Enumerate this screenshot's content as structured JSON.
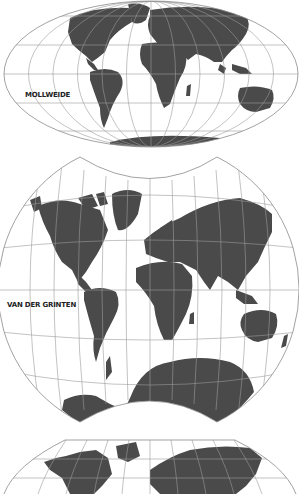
{
  "maps": [
    {
      "id": "mollweide",
      "label": "MOLLWEIDE",
      "label_pos": {
        "x": 25,
        "y": 91
      }
    },
    {
      "id": "van-der-grinten",
      "label": "VAN DER GRINTEN",
      "label_pos": {
        "x": 7,
        "y": 301
      }
    },
    {
      "id": "robinson-partial",
      "label": ""
    }
  ],
  "colors": {
    "land": "#4a4a4a",
    "grid": "#9a9a9a",
    "outline": "#8a8a8a",
    "background": "#ffffff"
  }
}
